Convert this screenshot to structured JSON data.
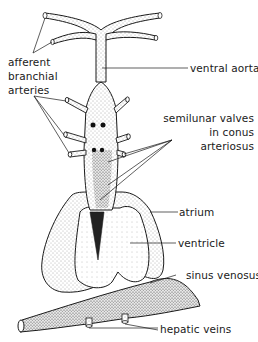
{
  "diagram": {
    "type": "anatomical illustration",
    "colors": {
      "ink": "#1a1a1a",
      "background": "#ffffff",
      "stipple": "#555555"
    }
  },
  "labels": {
    "afferent": {
      "lines": [
        "afferent",
        "branchial",
        "arteries"
      ]
    },
    "ventral_aorta": "ventral aorta",
    "semilunar": {
      "lines": [
        "semilunar valves",
        "in conus arteriosus"
      ]
    },
    "atrium": "atrium",
    "ventricle": "ventricle",
    "sinus_venosus": "sinus venosus",
    "hepatic_veins": "hepatic veins"
  }
}
